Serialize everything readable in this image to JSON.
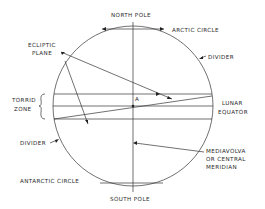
{
  "diagram": {
    "type": "lunar-globe-diagram",
    "labels": {
      "north_pole": "NORTH POLE",
      "arctic_circle": "ARCTIC CIRCLE",
      "ecliptic_plane_1": "ECLIPTIC",
      "ecliptic_plane_2": "PLANE",
      "divider_top": "DIVIDER",
      "torrid_zone_1": "TORRID",
      "torrid_zone_2": "ZONE",
      "center_point": "A",
      "lunar_equator_1": "LUNAR",
      "lunar_equator_2": "EQUATOR",
      "divider_bottom": "DIVIDER",
      "meridian_1": "MEDIAVOLVA",
      "meridian_2": "OR CENTRAL",
      "meridian_3": "MERIDIAN",
      "antarctic_circle": "ANTARCTIC CIRCLE",
      "south_pole": "SOUTH POLE"
    },
    "colors": {
      "line": "#333333",
      "text": "#2a2a2a",
      "background": "#ffffff"
    }
  }
}
